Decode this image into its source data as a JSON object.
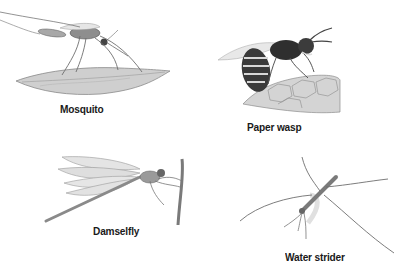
{
  "figure": {
    "panels": [
      {
        "id": "mosquito",
        "label": "Mosquito",
        "illustration": "mosquito-on-leaf"
      },
      {
        "id": "paper-wasp",
        "label": "Paper wasp",
        "illustration": "paper-wasp-on-nest"
      },
      {
        "id": "damselfly",
        "label": "Damselfly",
        "illustration": "damselfly-on-stem"
      },
      {
        "id": "water-strider",
        "label": "Water strider",
        "illustration": "water-strider-on-water"
      }
    ]
  }
}
